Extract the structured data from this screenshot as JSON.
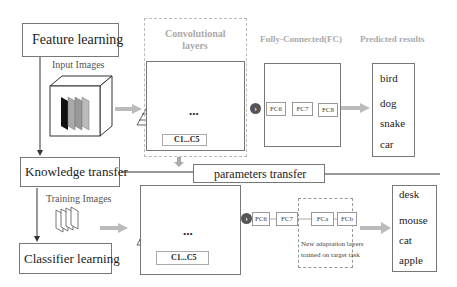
{
  "steps": {
    "feature_learning": "Feature learning",
    "knowledge_transfer": "Knowledge transfer",
    "classifier_learning": "Classifier learning"
  },
  "inputs": {
    "input_images": "Input Images",
    "training_images": "Training Images"
  },
  "headers": {
    "conv": "Convolutional layers",
    "fc": "Fully-Connected(FC)",
    "predicted": "Predicted results"
  },
  "conv_label_top": "C1...C5",
  "conv_label_bottom": "C1...C5",
  "params_transfer": "parameters transfer",
  "top_fc": [
    "FC6",
    "FC7",
    "FC8"
  ],
  "bottom_fc": [
    "FC6",
    "FC7",
    "FCa",
    "FCb"
  ],
  "adaptation_note": [
    "New adaptation layers",
    "trained on target task"
  ],
  "top_results": [
    "bird",
    "dog",
    "snake",
    "car"
  ],
  "bottom_results": [
    "desk",
    "mouse",
    "cat",
    "apple"
  ],
  "ellipsis": "..."
}
